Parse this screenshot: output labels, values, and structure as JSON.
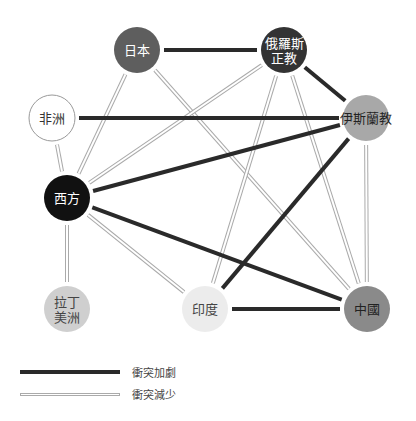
{
  "nodes": [
    {
      "id": "japan",
      "label_lines": [
        "日本"
      ],
      "x": 137,
      "y": 50,
      "fill": "#5e5e5e",
      "text_color": "#ffffff",
      "stroke": "none"
    },
    {
      "id": "orthodox",
      "label_lines": [
        "俄羅斯",
        "正教"
      ],
      "x": 284,
      "y": 50,
      "fill": "#333333",
      "text_color": "#ffffff",
      "stroke": "none"
    },
    {
      "id": "africa",
      "label_lines": [
        "非洲"
      ],
      "x": 52,
      "y": 118,
      "fill": "#ffffff",
      "text_color": "#333333",
      "stroke": "#999999"
    },
    {
      "id": "islam",
      "label_lines": [
        "伊斯蘭教"
      ],
      "x": 366,
      "y": 118,
      "fill": "#a8a8a8",
      "text_color": "#222222",
      "stroke": "none"
    },
    {
      "id": "west",
      "label_lines": [
        "西方"
      ],
      "x": 67,
      "y": 198,
      "fill": "#111111",
      "text_color": "#ffffff",
      "stroke": "none"
    },
    {
      "id": "latin_america",
      "label_lines": [
        "拉丁",
        "美洲"
      ],
      "x": 67,
      "y": 309,
      "fill": "#cfcfcf",
      "text_color": "#444444",
      "stroke": "none"
    },
    {
      "id": "india",
      "label_lines": [
        "印度"
      ],
      "x": 205,
      "y": 309,
      "fill": "#ececec",
      "text_color": "#444444",
      "stroke": "none"
    },
    {
      "id": "china",
      "label_lines": [
        "中國"
      ],
      "x": 367,
      "y": 309,
      "fill": "#8a8a8a",
      "text_color": "#222222",
      "stroke": "none"
    }
  ],
  "edges": [
    {
      "from": "japan",
      "to": "orthodox",
      "type": "heavy"
    },
    {
      "from": "orthodox",
      "to": "islam",
      "type": "heavy"
    },
    {
      "from": "africa",
      "to": "islam",
      "type": "heavy"
    },
    {
      "from": "west",
      "to": "islam",
      "type": "heavy"
    },
    {
      "from": "west",
      "to": "china",
      "type": "heavy"
    },
    {
      "from": "india",
      "to": "islam",
      "type": "heavy"
    },
    {
      "from": "india",
      "to": "china",
      "type": "heavy"
    },
    {
      "from": "japan",
      "to": "west",
      "type": "light"
    },
    {
      "from": "japan",
      "to": "china",
      "type": "light"
    },
    {
      "from": "orthodox",
      "to": "west",
      "type": "light"
    },
    {
      "from": "orthodox",
      "to": "india",
      "type": "light"
    },
    {
      "from": "orthodox",
      "to": "china",
      "type": "light"
    },
    {
      "from": "islam",
      "to": "china",
      "type": "light"
    },
    {
      "from": "africa",
      "to": "west",
      "type": "light"
    },
    {
      "from": "west",
      "to": "latin_america",
      "type": "light"
    },
    {
      "from": "west",
      "to": "india",
      "type": "light"
    }
  ],
  "node_radius": 23,
  "colors": {
    "heavy": "#2a2a2a",
    "light_border": "#aaaaaa",
    "light_fill": "#ffffff"
  },
  "legend": {
    "heavy_label": "衝突加劇",
    "light_label": "衝突減少"
  }
}
